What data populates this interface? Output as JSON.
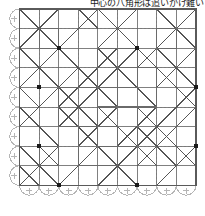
{
  "caption": {
    "text": "中心の八角形は追いかけ難い"
  },
  "figure": {
    "colors": {
      "border": "#5a5a5a",
      "grid_line": "#6a6a6a",
      "diagonal": "#555555",
      "dashed_guide": "#c9c9c9",
      "arc": "#b5b5b5",
      "vertex_dot": "#1a1a1a",
      "background": "#ffffff"
    },
    "geometry": {
      "cell": 19.6,
      "cols": 9,
      "rows": 9,
      "origin_x": 19.5,
      "origin_y": 9.0,
      "arc_radius": 9.8
    },
    "arc_edges": {
      "left_count": 9,
      "bottom_count": 9,
      "marker": "plus-tick"
    },
    "vertex_dots": [
      [
        2,
        2
      ],
      [
        6,
        2
      ],
      [
        1,
        4
      ],
      [
        9,
        4
      ],
      [
        1,
        7
      ],
      [
        9,
        7
      ],
      [
        2,
        9
      ],
      [
        6,
        9
      ]
    ],
    "outer_border": {
      "x": 19.5,
      "y": 9.0,
      "w": 176.4,
      "h": 176.4
    },
    "solid_grid_lines": {
      "vertical_cols": [
        0,
        1,
        2,
        3,
        4,
        5,
        6,
        7,
        8,
        9
      ],
      "horizontal_rows": [
        0,
        1,
        2,
        3,
        4,
        5,
        6,
        7,
        8,
        9
      ]
    },
    "dashed_guides": {
      "vertical_cols": [
        1,
        3,
        5,
        7,
        9
      ],
      "horizontal_rows": [
        1,
        3,
        5,
        7,
        9
      ]
    },
    "diagonals": {
      "down_right": [
        [
          0,
          0,
          2,
          2
        ],
        [
          4,
          0,
          6,
          2
        ],
        [
          0,
          2,
          2,
          4
        ],
        [
          4,
          2,
          6,
          4
        ],
        [
          2,
          2,
          5,
          5
        ],
        [
          6,
          2,
          9,
          5
        ],
        [
          0,
          4,
          1,
          5
        ],
        [
          2,
          4,
          4,
          6
        ],
        [
          0,
          5,
          2,
          7
        ],
        [
          4,
          5,
          5,
          6
        ],
        [
          5,
          3,
          7,
          5
        ],
        [
          1,
          7,
          2,
          8
        ],
        [
          3,
          6,
          5,
          8
        ],
        [
          0,
          7,
          2,
          9
        ],
        [
          4,
          7,
          6,
          9
        ],
        [
          6,
          5,
          9,
          8
        ],
        [
          2,
          5,
          4,
          7
        ],
        [
          7,
          0,
          9,
          2
        ],
        [
          7,
          2,
          9,
          4
        ],
        [
          5,
          6,
          7,
          8
        ],
        [
          3,
          0,
          4,
          1
        ],
        [
          6,
          6,
          8,
          8
        ],
        [
          0,
          8,
          1,
          9
        ],
        [
          8,
          3,
          9,
          4
        ]
      ],
      "down_left": [
        [
          2,
          0,
          0,
          2
        ],
        [
          4,
          0,
          2,
          2
        ],
        [
          6,
          0,
          4,
          2
        ],
        [
          9,
          0,
          7,
          2
        ],
        [
          2,
          2,
          0,
          4
        ],
        [
          6,
          2,
          4,
          4
        ],
        [
          9,
          2,
          7,
          4
        ],
        [
          5,
          2,
          2,
          5
        ],
        [
          9,
          4,
          7,
          6
        ],
        [
          4,
          4,
          2,
          6
        ],
        [
          5,
          5,
          3,
          7
        ],
        [
          9,
          5,
          6,
          8
        ],
        [
          2,
          7,
          0,
          9
        ],
        [
          6,
          7,
          4,
          9
        ],
        [
          4,
          7,
          2,
          9
        ],
        [
          9,
          7,
          7,
          9
        ],
        [
          7,
          5,
          5,
          7
        ],
        [
          3,
          3,
          1,
          5
        ],
        [
          8,
          1,
          6,
          3
        ],
        [
          5,
          8,
          4,
          9
        ],
        [
          7,
          6,
          6,
          7
        ],
        [
          4,
          6,
          3,
          7
        ],
        [
          1,
          5,
          0,
          6
        ],
        [
          8,
          8,
          7,
          9
        ]
      ]
    },
    "inner_rectangles": [
      [
        4,
        2,
        6,
        4
      ],
      [
        4,
        5,
        6,
        7
      ],
      [
        2,
        4,
        4,
        6
      ],
      [
        5,
        3,
        7,
        5
      ],
      [
        3,
        6,
        5,
        8
      ],
      [
        1,
        1,
        2,
        2
      ],
      [
        7,
        1,
        8,
        2
      ],
      [
        1,
        7,
        2,
        8
      ]
    ]
  }
}
